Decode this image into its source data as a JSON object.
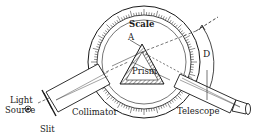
{
  "diagram": {
    "labels": {
      "scale": "Scale",
      "apex": "A",
      "prism": "Prism",
      "deviation": "D",
      "light_source_line1": "Light",
      "light_source_line2": "Source",
      "slit": "Slit",
      "collimator": "Collimator",
      "telescope": "Telescope"
    },
    "colors": {
      "ink": "#1a1a1a",
      "background": "#ffffff"
    }
  }
}
